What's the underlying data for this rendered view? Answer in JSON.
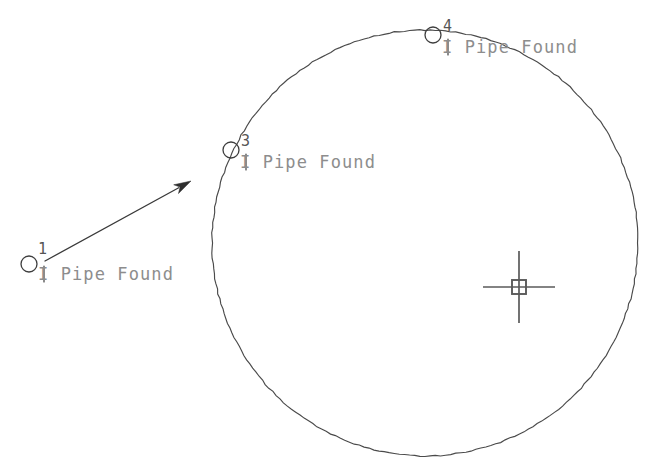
{
  "drawing": {
    "title": "Survey Plat Fragment",
    "background_color": "#ffffff",
    "line_color": "#4a4a4a",
    "label_color": "#8d8d8d",
    "index_color": "#555555"
  },
  "circle": {
    "name": "boundary-arc",
    "center_x": 425,
    "center_y": 243,
    "radius": 213
  },
  "points": [
    {
      "index": "1",
      "label": "I Pipe Found",
      "marker_x": 29,
      "marker_y": 264,
      "marker_r": 8,
      "index_x": 38,
      "index_y": 254,
      "label_x": 38,
      "label_y": 280,
      "tick_x": 44,
      "tick_top": 266,
      "tick_bottom": 282
    },
    {
      "index": "3",
      "label": "I Pipe Found",
      "marker_x": 231,
      "marker_y": 150,
      "marker_r": 8,
      "index_x": 241,
      "index_y": 146,
      "label_x": 240,
      "label_y": 168,
      "tick_x": 246,
      "tick_top": 154,
      "tick_bottom": 170
    },
    {
      "index": "4",
      "label": "I Pipe Found",
      "marker_x": 433,
      "marker_y": 35,
      "marker_r": 8,
      "index_x": 443,
      "index_y": 31,
      "label_x": 442,
      "label_y": 53,
      "tick_x": 448,
      "tick_top": 39,
      "tick_bottom": 55
    }
  ],
  "arrow": {
    "name": "direction-arrow",
    "from_x": 45,
    "from_y": 261,
    "to_x": 191,
    "to_y": 181
  },
  "monument": {
    "name": "center-monument-marker",
    "x": 519,
    "y": 287,
    "square_size": 14,
    "arm_length": 36
  }
}
